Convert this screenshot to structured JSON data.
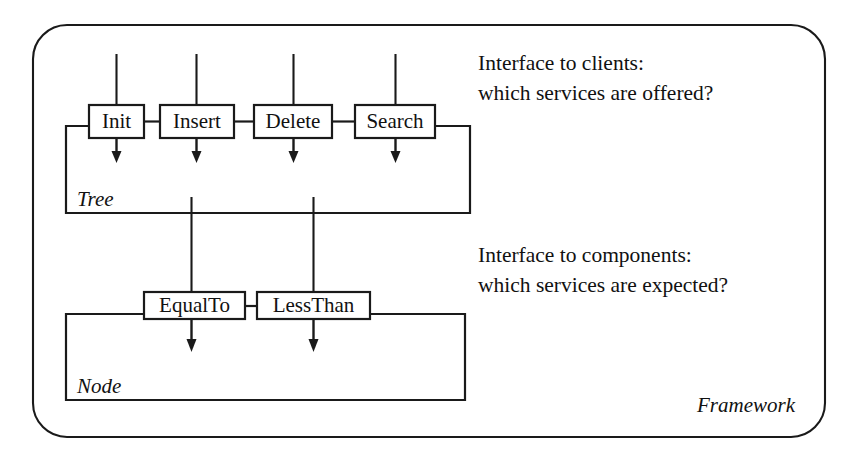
{
  "diagram": {
    "title": "Framework",
    "frame_label": "Framework",
    "background_color": "#ffffff",
    "line_color": "#1a1a1a",
    "containers": [
      {
        "id": "tree",
        "label": "Tree",
        "operations": [
          {
            "id": "init",
            "label": "Init"
          },
          {
            "id": "insert",
            "label": "Insert"
          },
          {
            "id": "delete",
            "label": "Delete"
          },
          {
            "id": "search",
            "label": "Search"
          }
        ]
      },
      {
        "id": "node",
        "label": "Node",
        "operations": [
          {
            "id": "equalto",
            "label": "EqualTo"
          },
          {
            "id": "lessthan",
            "label": "LessThan"
          }
        ]
      }
    ],
    "annotations": [
      {
        "id": "interface-to-clients",
        "line1": "Interface to clients:",
        "line2": "which services are offered?"
      },
      {
        "id": "interface-to-components",
        "line1": "Interface to components:",
        "line2": "which services are expected?"
      }
    ]
  }
}
